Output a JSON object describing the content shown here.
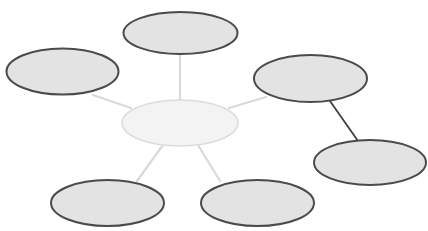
{
  "diagram": {
    "type": "mind-map / spider diagram",
    "background": "#ffffff",
    "colors": {
      "outer_fill": "#e3e3e3",
      "outer_stroke": "#4a4a4a",
      "center_fill": "#f3f3f3",
      "center_stroke": "#dcdcdc",
      "connector_light": "#d9d9d9",
      "connector_dark": "#3f3f3f"
    },
    "center": {
      "label": "",
      "cx": 180,
      "cy": 123,
      "rx": 58,
      "ry": 23
    },
    "nodes": [
      {
        "id": "top",
        "label": "",
        "cx": 180.5,
        "cy": 33,
        "rx": 57,
        "ry": 21
      },
      {
        "id": "upper-left",
        "label": "",
        "cx": 62.5,
        "cy": 71.5,
        "rx": 56,
        "ry": 23
      },
      {
        "id": "right",
        "label": "",
        "cx": 310.5,
        "cy": 78.5,
        "rx": 56.5,
        "ry": 23.5
      },
      {
        "id": "far-right",
        "label": "",
        "cx": 370,
        "cy": 162.5,
        "rx": 56,
        "ry": 22.5
      },
      {
        "id": "bottom-left",
        "label": "",
        "cx": 107.5,
        "cy": 203,
        "rx": 56.5,
        "ry": 23
      },
      {
        "id": "bottom-right",
        "label": "",
        "cx": 257.5,
        "cy": 203,
        "rx": 56.5,
        "ry": 23
      }
    ],
    "connectors": [
      {
        "from": "center",
        "to": "top",
        "style": "light"
      },
      {
        "from": "center",
        "to": "upper-left",
        "style": "light"
      },
      {
        "from": "center",
        "to": "right",
        "style": "light"
      },
      {
        "from": "center",
        "to": "bottom-left",
        "style": "light"
      },
      {
        "from": "center",
        "to": "bottom-right",
        "style": "light"
      },
      {
        "from": "right",
        "to": "far-right",
        "style": "dark"
      }
    ]
  }
}
